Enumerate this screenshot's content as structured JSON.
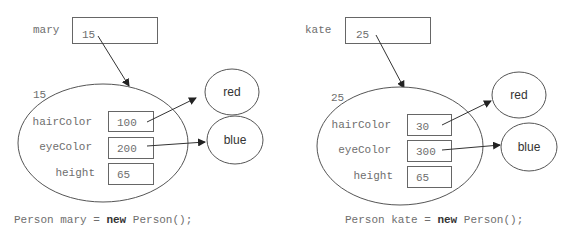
{
  "diagram": {
    "colors": {
      "stroke": "#555555",
      "text_mono": "#6e6e6e",
      "text_sans": "#333333",
      "background": "#ffffff"
    },
    "objects": [
      {
        "variable": "mary",
        "reference_value": "15",
        "object_address": "15",
        "fields": [
          {
            "name": "hairColor",
            "value": "100"
          },
          {
            "name": "eyeColor",
            "value": "200"
          },
          {
            "name": "height",
            "value": "65"
          }
        ],
        "referenced_strings": [
          "red",
          "blue"
        ],
        "code": {
          "prefix": "Person mary = ",
          "keyword": "new",
          "suffix": " Person();"
        }
      },
      {
        "variable": "kate",
        "reference_value": "25",
        "object_address": "25",
        "fields": [
          {
            "name": "hairColor",
            "value": "30"
          },
          {
            "name": "eyeColor",
            "value": "300"
          },
          {
            "name": "height",
            "value": "65"
          }
        ],
        "referenced_strings": [
          "red",
          "blue"
        ],
        "code": {
          "prefix": "Person kate = ",
          "keyword": "new",
          "suffix": " Person();"
        }
      }
    ]
  }
}
